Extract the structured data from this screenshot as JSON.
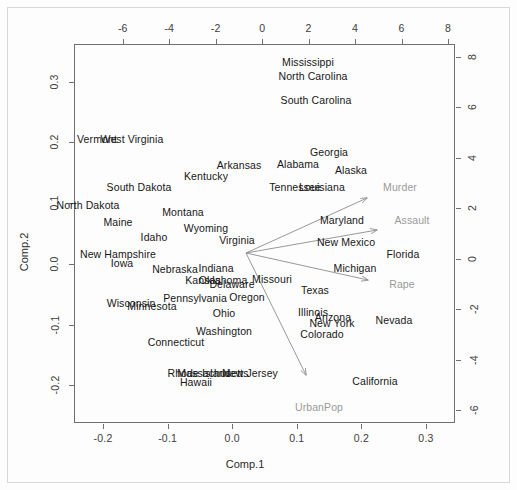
{
  "plot": {
    "title": "",
    "xlabel_bottom": "Comp.1",
    "ylabel_left": "Comp.2",
    "var_color": "#9a9a9a",
    "obs_color": "#171717",
    "axis_color": "#6f6f6f"
  },
  "chart_data": {
    "type": "scatter",
    "title": "",
    "subtitle": "",
    "xlabel": "Comp.1",
    "ylabel": "Comp.2",
    "grid": false,
    "legend": "none",
    "note": "PCA biplot of USArrests: observation scores on bottom/left axes, variable loadings arrows on top/right axes",
    "axes": {
      "bottom": {
        "label": "Comp.1",
        "ticks": [
          -0.2,
          -0.1,
          0.0,
          0.1,
          0.2,
          0.3
        ],
        "tick_labels": [
          "-0.2",
          "-0.1",
          "0.0",
          "0.1",
          "0.2",
          "0.3"
        ],
        "lim": [
          -0.245,
          0.345
        ]
      },
      "left": {
        "label": "Comp.2",
        "ticks": [
          0.3,
          0.2,
          0.1,
          0.0,
          -0.1,
          -0.2
        ],
        "tick_labels": [
          "0.3",
          "0.2",
          "0.1",
          "0.0",
          "-0.1",
          "-0.2"
        ],
        "lim": [
          -0.262,
          0.362
        ]
      },
      "top": {
        "label": "",
        "ticks": [
          -6,
          -4,
          -2,
          0,
          2,
          4,
          6,
          8
        ],
        "tick_labels": [
          "-6",
          "-4",
          "-2",
          "0",
          "2",
          "4",
          "6",
          "8"
        ],
        "lim": [
          -8.1,
          8.3
        ]
      },
      "right": {
        "label": "",
        "ticks": [
          8,
          6,
          4,
          2,
          0,
          -2,
          -4,
          -6
        ],
        "tick_labels": [
          "8",
          "6",
          "4",
          "2",
          "0",
          "-2",
          "-4",
          "-6"
        ],
        "lim": [
          -6.5,
          8.5
        ]
      }
    },
    "observations": [
      {
        "label": "Mississippi",
        "px": 308,
        "py": 62
      },
      {
        "label": "North Carolina",
        "px": 313,
        "py": 76
      },
      {
        "label": "South Carolina",
        "px": 316,
        "py": 100
      },
      {
        "label": "Vermont",
        "px": 97,
        "py": 139
      },
      {
        "label": "West Virginia",
        "px": 132,
        "py": 139
      },
      {
        "label": "Georgia",
        "px": 329,
        "py": 152
      },
      {
        "label": "Arkansas",
        "px": 239,
        "py": 165
      },
      {
        "label": "Alabama",
        "px": 298,
        "py": 164
      },
      {
        "label": "Alaska",
        "px": 351,
        "py": 170
      },
      {
        "label": "Kentucky",
        "px": 206,
        "py": 176
      },
      {
        "label": "Tennessee",
        "px": 295,
        "py": 187
      },
      {
        "label": "Louisiana",
        "px": 322,
        "py": 187
      },
      {
        "label": "South Dakota",
        "px": 139,
        "py": 187
      },
      {
        "label": "North Dakota",
        "px": 88,
        "py": 205
      },
      {
        "label": "Montana",
        "px": 183,
        "py": 212
      },
      {
        "label": "Maine",
        "px": 118,
        "py": 222
      },
      {
        "label": "Wyoming",
        "px": 206,
        "py": 228
      },
      {
        "label": "Maryland",
        "px": 342,
        "py": 220
      },
      {
        "label": "Idaho",
        "px": 154,
        "py": 237
      },
      {
        "label": "Virginia",
        "px": 237,
        "py": 240
      },
      {
        "label": "New Mexico",
        "px": 346,
        "py": 242
      },
      {
        "label": "New Hampshire",
        "px": 118,
        "py": 254
      },
      {
        "label": "Florida",
        "px": 403,
        "py": 254
      },
      {
        "label": "Iowa",
        "px": 122,
        "py": 263
      },
      {
        "label": "Nebraska",
        "px": 175,
        "py": 269
      },
      {
        "label": "Indiana",
        "px": 216,
        "py": 268
      },
      {
        "label": "Michigan",
        "px": 355,
        "py": 268
      },
      {
        "label": "Kansas",
        "px": 203,
        "py": 280
      },
      {
        "label": "Oklahoma",
        "px": 223,
        "py": 280
      },
      {
        "label": "Delaware",
        "px": 232,
        "py": 284
      },
      {
        "label": "Missouri",
        "px": 272,
        "py": 279
      },
      {
        "label": "Texas",
        "px": 315,
        "py": 290
      },
      {
        "label": "Pennsylvania",
        "px": 195,
        "py": 298
      },
      {
        "label": "Oregon",
        "px": 247,
        "py": 297
      },
      {
        "label": "Wisconsin",
        "px": 131,
        "py": 303
      },
      {
        "label": "Minnesota",
        "px": 152,
        "py": 306
      },
      {
        "label": "Ohio",
        "px": 224,
        "py": 313
      },
      {
        "label": "Illinois",
        "px": 313,
        "py": 312
      },
      {
        "label": "Arizona",
        "px": 333,
        "py": 317
      },
      {
        "label": "New York",
        "px": 332,
        "py": 323
      },
      {
        "label": "Nevada",
        "px": 394,
        "py": 320
      },
      {
        "label": "Colorado",
        "px": 322,
        "py": 334
      },
      {
        "label": "Washington",
        "px": 224,
        "py": 331
      },
      {
        "label": "Connecticut",
        "px": 176,
        "py": 342
      },
      {
        "label": "Rhode Island",
        "px": 199,
        "py": 373
      },
      {
        "label": "Massachusetts",
        "px": 213,
        "py": 373
      },
      {
        "label": "New Jersey",
        "px": 250,
        "py": 373
      },
      {
        "label": "Hawaii",
        "px": 196,
        "py": 382
      },
      {
        "label": "California",
        "px": 375,
        "py": 381
      }
    ],
    "variables": [
      {
        "label": "Murder",
        "tip_px": 367,
        "tip_py": 198,
        "label_px": 400,
        "label_py": 187
      },
      {
        "label": "Assault",
        "tip_px": 377,
        "tip_py": 230,
        "label_px": 412,
        "label_py": 220
      },
      {
        "label": "Rape",
        "tip_px": 368,
        "tip_py": 280,
        "label_px": 402,
        "label_py": 284
      },
      {
        "label": "UrbanPop",
        "tip_px": 306,
        "tip_py": 375,
        "label_px": 319,
        "label_py": 407
      }
    ],
    "origin": {
      "px": 246,
      "py": 253
    }
  }
}
